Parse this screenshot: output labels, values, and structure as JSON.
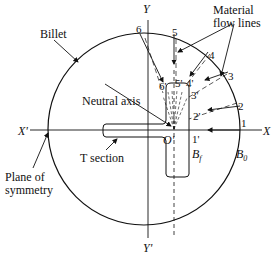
{
  "labels": {
    "billet": "Billet",
    "material_flow_1": "Material",
    "material_flow_2": "flow lines",
    "neutral_axis": "Neutral axis",
    "t_section": "T  section",
    "plane_1": "Plane of",
    "plane_2": "symmetry",
    "x_axis": "X",
    "x_prime": "X'",
    "y_axis": "Y",
    "y_prime": "Y'",
    "origin": "O'",
    "bf": "B",
    "bf_sub": "f",
    "b0": "B",
    "b0_sub": "0"
  },
  "points_outer": [
    "1",
    "2",
    "3",
    "4",
    "5",
    "6"
  ],
  "points_inner": [
    "1'",
    "2'",
    "3'",
    "4'",
    "5'",
    "6'"
  ]
}
